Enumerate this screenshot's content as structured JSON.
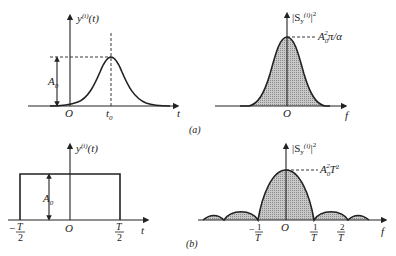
{
  "figure": {
    "panel_a": {
      "caption": "(a)",
      "time_plot": {
        "ylabel": "y(i)(t)",
        "ylabel_base": "y",
        "ylabel_sup": "(i)",
        "ylabel_arg": "(t)",
        "xlabel": "t",
        "origin": "O",
        "peak_label": "t",
        "peak_label_sub": "0",
        "amplitude_label": "A",
        "amplitude_sub": "0",
        "shape": "gaussian pulse centered at t0"
      },
      "spectrum_plot": {
        "ylabel": "|Sy(i)|^2",
        "ylabel_bar_open": "|S",
        "ylabel_sub": "y",
        "ylabel_sup": "(i)",
        "ylabel_close": "|",
        "ylabel_pow": "2",
        "xlabel": "f",
        "origin": "O",
        "peak_value_label": "A0^2 π/α",
        "peak_A": "A",
        "peak_sub": "0",
        "peak_sup": "2",
        "peak_rest": "π/α",
        "shape": "gaussian, shaded"
      }
    },
    "panel_b": {
      "caption": "(b)",
      "time_plot": {
        "ylabel_base": "y",
        "ylabel_sup": "(i)",
        "ylabel_arg": "(t)",
        "xlabel": "t",
        "origin": "O",
        "left_tick_num": "T",
        "left_tick_sign": "−",
        "left_tick_den": "2",
        "right_tick_num": "T",
        "right_tick_den": "2",
        "amplitude_label": "A",
        "amplitude_sub": "0",
        "shape": "rectangular pulse from -T/2 to T/2"
      },
      "spectrum_plot": {
        "ylabel_bar_open": "|S",
        "ylabel_sub": "y",
        "ylabel_sup": "(i)",
        "ylabel_close": "|",
        "ylabel_pow": "2",
        "xlabel": "f",
        "origin": "O",
        "peak_A": "A",
        "peak_sub": "0",
        "peak_sup": "2",
        "peak_T": "T",
        "peak_T_pow": "2",
        "ticks": [
          {
            "sign": "−",
            "num": "1",
            "den": "T"
          },
          {
            "sign": "",
            "num": "1",
            "den": "T"
          },
          {
            "sign": "",
            "num": "2",
            "den": "T"
          }
        ],
        "shape": "sinc^2, shaded main lobe and sidelobes"
      }
    }
  }
}
